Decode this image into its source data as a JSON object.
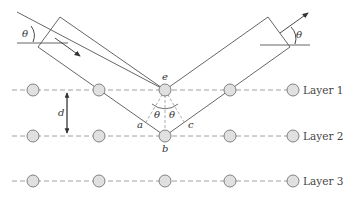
{
  "diagram": {
    "layers": [
      {
        "label": "Layer 1",
        "y": 90
      },
      {
        "label": "Layer 2",
        "y": 136
      },
      {
        "label": "Layer 3",
        "y": 181
      }
    ],
    "atom_x": [
      33,
      99,
      165,
      230,
      293
    ],
    "points": {
      "e": "e",
      "b": "b",
      "a": "a",
      "c": "c"
    },
    "angle_symbol": "θ",
    "spacing_label": "d",
    "colors": {
      "line": "#555555",
      "atom_fill": "#e0e0e0",
      "dash": "#777777"
    }
  }
}
